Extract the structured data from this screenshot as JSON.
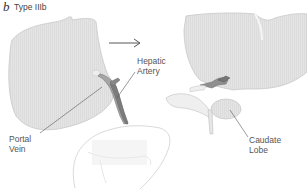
{
  "figure": {
    "panel_letter": "b",
    "panel_title": "Type IIIb",
    "labels": {
      "hepatic_artery": {
        "line1": "Hepatic",
        "line2": "Artery"
      },
      "portal_vein": {
        "line1": "Portal",
        "line2": "Vein"
      },
      "caudate_lobe": {
        "line1": "Caudate",
        "line2": "Lobe"
      }
    },
    "arrow": "transition-arrow",
    "colors": {
      "liver_fill": "#e6e6e6",
      "liver_stroke": "#c8c8c8",
      "vessel_fill": "#9a9a9a",
      "vessel_dark": "#6e6e6e",
      "leader_line": "#555555",
      "text": "#555555"
    }
  }
}
